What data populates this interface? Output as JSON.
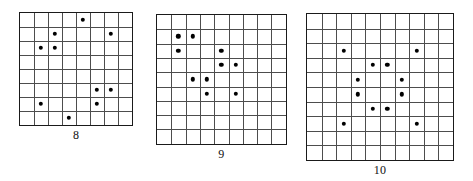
{
  "figure": {
    "background_color": "#ffffff",
    "grid_line_color": "#4d4d4d",
    "border_color": "#1a1a1a",
    "dot_color": "#000000",
    "panels": [
      {
        "label": "8",
        "size": 8,
        "cell_px": 14.0,
        "left": 19,
        "top": 12,
        "dots": [
          {
            "row": 0,
            "col": 4
          },
          {
            "row": 1,
            "col": 2
          },
          {
            "row": 1,
            "col": 6
          },
          {
            "row": 2,
            "col": 1
          },
          {
            "row": 2,
            "col": 2
          },
          {
            "row": 5,
            "col": 5
          },
          {
            "row": 5,
            "col": 6
          },
          {
            "row": 6,
            "col": 1
          },
          {
            "row": 6,
            "col": 5
          },
          {
            "row": 7,
            "col": 3
          }
        ]
      },
      {
        "label": "9",
        "size": 9,
        "cell_px": 14.3,
        "left": 156,
        "top": 14,
        "dots": [
          {
            "row": 1,
            "col": 1
          },
          {
            "row": 1,
            "col": 2
          },
          {
            "row": 2,
            "col": 1
          },
          {
            "row": 2,
            "col": 4
          },
          {
            "row": 3,
            "col": 4
          },
          {
            "row": 3,
            "col": 5
          },
          {
            "row": 4,
            "col": 2
          },
          {
            "row": 4,
            "col": 3
          },
          {
            "row": 5,
            "col": 3
          },
          {
            "row": 5,
            "col": 5
          }
        ]
      },
      {
        "label": "10",
        "size": 10,
        "cell_px": 14.6,
        "left": 306,
        "top": 13,
        "dots": [
          {
            "row": 2,
            "col": 2
          },
          {
            "row": 2,
            "col": 7
          },
          {
            "row": 3,
            "col": 4
          },
          {
            "row": 3,
            "col": 5
          },
          {
            "row": 4,
            "col": 3
          },
          {
            "row": 4,
            "col": 6
          },
          {
            "row": 5,
            "col": 3
          },
          {
            "row": 5,
            "col": 6
          },
          {
            "row": 6,
            "col": 4
          },
          {
            "row": 6,
            "col": 5
          },
          {
            "row": 7,
            "col": 2
          },
          {
            "row": 7,
            "col": 7
          }
        ]
      }
    ]
  }
}
